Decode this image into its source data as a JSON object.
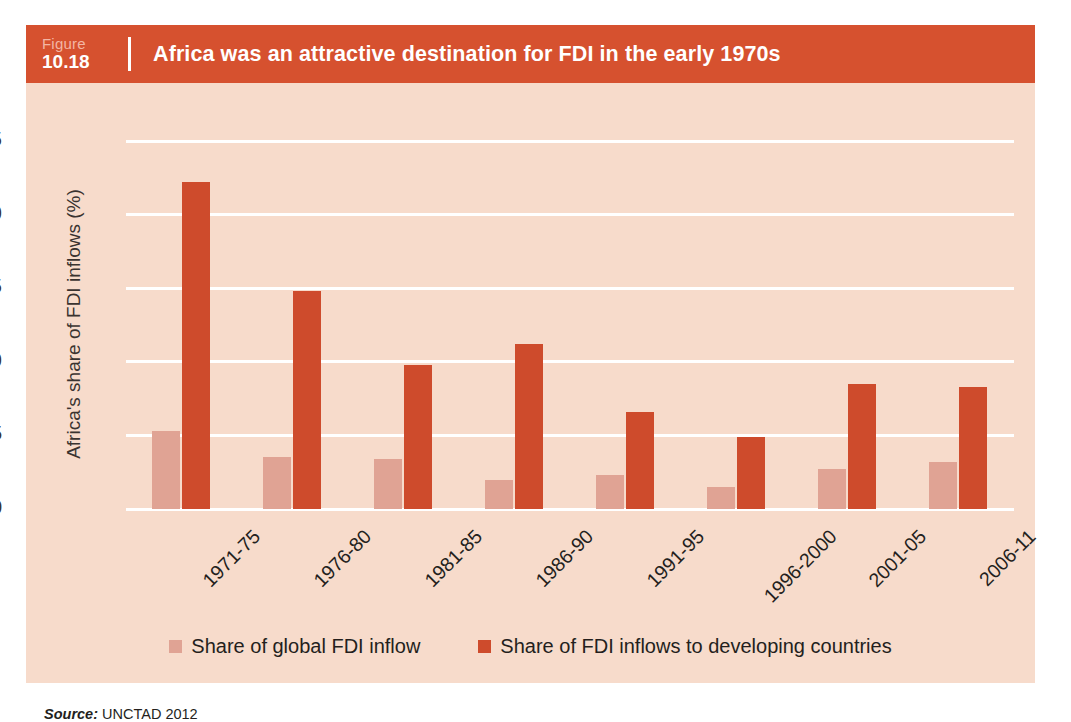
{
  "figure": {
    "label_word": "Figure",
    "number": "10.18",
    "title": "Africa was an attractive destination for FDI in the early 1970s",
    "source_label": "Source:",
    "source_text": "UNCTAD 2012"
  },
  "colors": {
    "header_bar": "#d6512f",
    "panel_background": "#f7dbcb",
    "series_light": "#e0a394",
    "series_dark": "#ce4b2c",
    "gridline": "#ffffff",
    "text": "#241f1d"
  },
  "chart_data": {
    "type": "bar",
    "title": "Africa was an attractive destination for FDI in the early 1970s",
    "xlabel": "",
    "ylabel": "Africa's share of FDI inflows (%)",
    "ylim": [
      0,
      25
    ],
    "yticks": [
      0,
      5,
      10,
      15,
      20,
      25
    ],
    "ytick_labels": [
      "0",
      "5",
      "10",
      "15",
      "20",
      "25"
    ],
    "grid": true,
    "legend_position": "bottom",
    "categories": [
      "1971-75",
      "1976-80",
      "1981-85",
      "1986-90",
      "1991-95",
      "1996-2000",
      "2001-05",
      "2006-11"
    ],
    "series": [
      {
        "name": "Share of global FDI inflow",
        "color": "#e0a394",
        "values": [
          5.3,
          3.5,
          3.4,
          2.0,
          2.3,
          1.5,
          2.7,
          3.2
        ]
      },
      {
        "name": "Share of FDI inflows to developing countries",
        "color": "#ce4b2c",
        "values": [
          22.2,
          14.8,
          9.8,
          11.2,
          6.6,
          4.9,
          8.5,
          8.3
        ]
      }
    ]
  }
}
